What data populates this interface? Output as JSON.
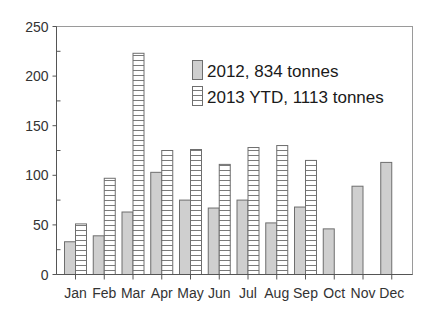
{
  "chart_data": {
    "type": "bar",
    "title": "",
    "xlabel": "",
    "ylabel": "",
    "ylim": [
      0,
      250
    ],
    "yticks": [
      0,
      50,
      100,
      150,
      200,
      250
    ],
    "grid": false,
    "legend_position": "upper-right-inside",
    "categories": [
      "Jan",
      "Feb",
      "Mar",
      "Apr",
      "May",
      "Jun",
      "Jul",
      "Aug",
      "Sep",
      "Oct",
      "Nov",
      "Dec"
    ],
    "series": [
      {
        "name": "2012, 834 tonnes",
        "style": "solid-gray",
        "values": [
          33,
          39,
          63,
          103,
          75,
          67,
          75,
          52,
          68,
          46,
          89,
          113
        ]
      },
      {
        "name": "2013 YTD, 1113 tonnes",
        "style": "horizontal-hatch",
        "values": [
          51,
          97,
          223,
          125,
          126,
          111,
          128,
          130,
          115,
          null,
          null,
          null
        ]
      }
    ]
  },
  "colors": {
    "series_2012_fill": "#cfcfcf",
    "series_2013_fill": "#ffffff",
    "bar_stroke": "#6e6e6e",
    "hatch_stroke": "#7a7a7a",
    "axis": "#555555",
    "frame": "#999999"
  }
}
